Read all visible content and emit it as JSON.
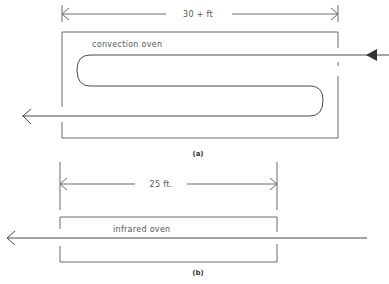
{
  "figures": {
    "a": {
      "caption": "(a)",
      "dimension_label": "30 + ft",
      "oven_label": "convection oven",
      "path_type": "serpentine",
      "passes": 3
    },
    "b": {
      "caption": "(b)",
      "dimension_label": "25 ft.",
      "oven_label": "infrared oven",
      "path_type": "straight",
      "passes": 1
    }
  },
  "colors": {
    "line": "#6a6a6a",
    "text": "#555555",
    "background": "#ffffff"
  }
}
